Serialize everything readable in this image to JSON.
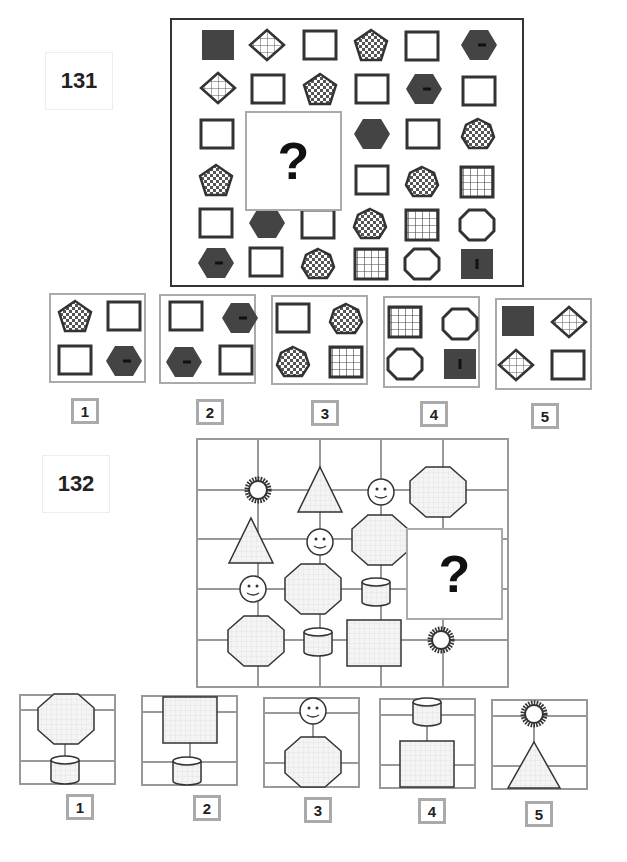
{
  "puzzles": [
    {
      "number": "131",
      "question_mark": "?",
      "matrix_rows": [
        [
          "dark-square",
          "hatched-diamond",
          "empty-square",
          "checkered-pentagon",
          "empty-square",
          "dark-hexagon-dash"
        ],
        [
          "hatched-diamond",
          "empty-square",
          "checkered-pentagon",
          "empty-square",
          "dark-hexagon-dash",
          "empty-square"
        ],
        [
          "empty-square",
          "?",
          "?",
          "dark-hexagon",
          "empty-square",
          "checkered-heptagon"
        ],
        [
          "checkered-pentagon",
          "?",
          "?",
          "empty-square",
          "checkered-heptagon",
          "grid-square"
        ],
        [
          "empty-square",
          "dark-hexagon",
          "empty-square",
          "checkered-heptagon",
          "grid-square",
          "empty-octagon"
        ],
        [
          "dark-hexagon-dash",
          "empty-square",
          "checkered-heptagon",
          "grid-square",
          "empty-octagon",
          "dark-square-bar"
        ]
      ],
      "options": [
        {
          "label": "1",
          "cells": [
            "checkered-pentagon",
            "empty-square",
            "empty-square",
            "dark-hexagon-dash"
          ]
        },
        {
          "label": "2",
          "cells": [
            "empty-square",
            "dark-hexagon-dash",
            "dark-hexagon-dash",
            "empty-square"
          ]
        },
        {
          "label": "3",
          "cells": [
            "empty-square",
            "checkered-heptagon",
            "checkered-heptagon",
            "grid-square"
          ]
        },
        {
          "label": "4",
          "cells": [
            "grid-square",
            "empty-octagon",
            "empty-octagon",
            "dark-square-bar"
          ]
        },
        {
          "label": "5",
          "cells": [
            "dark-square",
            "hatched-diamond",
            "hatched-diamond",
            "empty-square"
          ]
        }
      ]
    },
    {
      "number": "132",
      "question_mark": "?",
      "diagonal_sequence": [
        "sun",
        "triangle",
        "smiley",
        "octagon",
        "cylinder",
        "square"
      ],
      "options": [
        {
          "label": "1",
          "top": "octagon",
          "bottom": "cylinder"
        },
        {
          "label": "2",
          "top": "square",
          "bottom": "cylinder"
        },
        {
          "label": "3",
          "top": "smiley",
          "bottom": "octagon"
        },
        {
          "label": "4",
          "top": "cylinder",
          "bottom": "square"
        },
        {
          "label": "5",
          "top": "sun",
          "bottom": "triangle"
        }
      ]
    }
  ]
}
